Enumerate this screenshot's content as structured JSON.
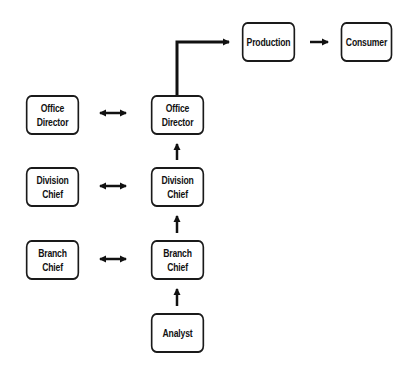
{
  "diagram": {
    "type": "organizational-flow",
    "nodes": [
      {
        "id": "production",
        "label": "Production"
      },
      {
        "id": "consumer",
        "label": "Consumer"
      },
      {
        "id": "office_director_left",
        "label": "Office Director"
      },
      {
        "id": "office_director_right",
        "label": "Office Director"
      },
      {
        "id": "division_chief_left",
        "label": "Division\nChief"
      },
      {
        "id": "division_chief_right",
        "label": "Division\nChief"
      },
      {
        "id": "branch_chief_left",
        "label": "Branch\nChief"
      },
      {
        "id": "branch_chief_right",
        "label": "Branch\nChief"
      },
      {
        "id": "analyst",
        "label": "Analyst"
      }
    ],
    "edges": [
      {
        "from": "analyst",
        "to": "branch_chief_right",
        "type": "arrow"
      },
      {
        "from": "branch_chief_right",
        "to": "division_chief_right",
        "type": "arrow"
      },
      {
        "from": "division_chief_right",
        "to": "office_director_right",
        "type": "arrow"
      },
      {
        "from": "office_director_right",
        "to": "production",
        "type": "elbow-arrow"
      },
      {
        "from": "production",
        "to": "consumer",
        "type": "arrow"
      },
      {
        "from": "office_director_left",
        "to": "office_director_right",
        "type": "bidirectional"
      },
      {
        "from": "division_chief_left",
        "to": "division_chief_right",
        "type": "bidirectional"
      },
      {
        "from": "branch_chief_left",
        "to": "branch_chief_right",
        "type": "bidirectional"
      }
    ]
  }
}
